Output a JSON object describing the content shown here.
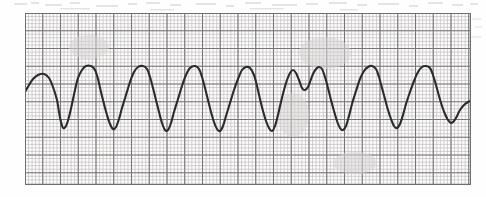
{
  "document": {
    "type": "ecg-rhythm-strip",
    "caption": "",
    "background_color": "#fefefe",
    "paper_color": "#fdfdfd"
  },
  "strip": {
    "label": "ecg-rhythm-strip",
    "x": 25,
    "y": 13,
    "width": 446,
    "height": 172,
    "border_color": "#6f6f6f",
    "trace_color": "#2b2b2b",
    "minor_grid_color": "#b9b4b4",
    "major_grid_color": "#7b7676",
    "minor_grid_px": 3.55,
    "major_grid_px": 17.75
  },
  "chart_data": {
    "type": "line",
    "title": "",
    "subtitle": "",
    "xlabel": "",
    "ylabel": "",
    "grid": true,
    "legend": "none",
    "rhythm_name": "sine-wave wide-complex tachycardia",
    "baseline_y": 100,
    "peak_y": 66,
    "trough_y": 133,
    "amplitude_mm": 19,
    "cycle_count": 13,
    "cycle_px": 33.5,
    "xlim": [
      25,
      471
    ],
    "ylim": [
      13,
      185
    ],
    "axis_units": {
      "x": "0.04 s per small square",
      "y": "0.1 mV per small square"
    },
    "peaks_x": [
      44,
      75,
      109,
      143,
      176,
      210,
      244,
      277,
      306,
      340,
      371,
      404,
      438
    ],
    "troughs_x": [
      58,
      92,
      126,
      159,
      193,
      226,
      259,
      291,
      324,
      356,
      388,
      421
    ],
    "series": [
      {
        "name": "lead-ii",
        "points": [
          [
            25,
            92
          ],
          [
            29,
            85
          ],
          [
            33,
            79
          ],
          [
            38,
            75
          ],
          [
            44,
            74
          ],
          [
            49,
            78
          ],
          [
            53,
            87
          ],
          [
            57,
            100
          ],
          [
            59,
            112
          ],
          [
            61,
            122
          ],
          [
            63,
            128
          ],
          [
            66,
            126
          ],
          [
            69,
            117
          ],
          [
            72,
            104
          ],
          [
            75,
            90
          ],
          [
            78,
            78
          ],
          [
            82,
            70
          ],
          [
            86,
            66
          ],
          [
            91,
            66
          ],
          [
            95,
            70
          ],
          [
            98,
            79
          ],
          [
            101,
            92
          ],
          [
            104,
            104
          ],
          [
            107,
            115
          ],
          [
            110,
            124
          ],
          [
            113,
            129
          ],
          [
            116,
            127
          ],
          [
            119,
            119
          ],
          [
            122,
            108
          ],
          [
            126,
            95
          ],
          [
            130,
            82
          ],
          [
            134,
            72
          ],
          [
            138,
            67
          ],
          [
            143,
            66
          ],
          [
            147,
            69
          ],
          [
            150,
            77
          ],
          [
            153,
            88
          ],
          [
            156,
            100
          ],
          [
            159,
            112
          ],
          [
            162,
            123
          ],
          [
            165,
            130
          ],
          [
            168,
            130
          ],
          [
            171,
            123
          ],
          [
            174,
            112
          ],
          [
            178,
            99
          ],
          [
            182,
            86
          ],
          [
            186,
            75
          ],
          [
            190,
            68
          ],
          [
            195,
            66
          ],
          [
            199,
            69
          ],
          [
            202,
            77
          ],
          [
            205,
            88
          ],
          [
            208,
            100
          ],
          [
            211,
            112
          ],
          [
            214,
            122
          ],
          [
            217,
            129
          ],
          [
            220,
            131
          ],
          [
            223,
            126
          ],
          [
            226,
            116
          ],
          [
            230,
            103
          ],
          [
            234,
            90
          ],
          [
            238,
            79
          ],
          [
            242,
            70
          ],
          [
            246,
            67
          ],
          [
            250,
            68
          ],
          [
            254,
            75
          ],
          [
            257,
            86
          ],
          [
            260,
            99
          ],
          [
            263,
            111
          ],
          [
            266,
            121
          ],
          [
            269,
            128
          ],
          [
            272,
            131
          ],
          [
            275,
            126
          ],
          [
            278,
            115
          ],
          [
            281,
            102
          ],
          [
            284,
            90
          ],
          [
            287,
            80
          ],
          [
            290,
            73
          ],
          [
            293,
            70
          ],
          [
            296,
            73
          ],
          [
            299,
            80
          ],
          [
            302,
            88
          ],
          [
            305,
            90
          ],
          [
            308,
            87
          ],
          [
            310,
            82
          ],
          [
            313,
            74
          ],
          [
            316,
            69
          ],
          [
            319,
            67
          ],
          [
            322,
            69
          ],
          [
            325,
            77
          ],
          [
            328,
            88
          ],
          [
            331,
            100
          ],
          [
            334,
            111
          ],
          [
            337,
            121
          ],
          [
            340,
            128
          ],
          [
            343,
            130
          ],
          [
            346,
            126
          ],
          [
            349,
            116
          ],
          [
            352,
            104
          ],
          [
            356,
            91
          ],
          [
            360,
            79
          ],
          [
            364,
            71
          ],
          [
            368,
            67
          ],
          [
            372,
            66
          ],
          [
            376,
            69
          ],
          [
            379,
            77
          ],
          [
            382,
            88
          ],
          [
            385,
            99
          ],
          [
            388,
            110
          ],
          [
            391,
            119
          ],
          [
            394,
            126
          ],
          [
            397,
            128
          ],
          [
            400,
            124
          ],
          [
            403,
            115
          ],
          [
            406,
            104
          ],
          [
            410,
            92
          ],
          [
            414,
            81
          ],
          [
            418,
            72
          ],
          [
            422,
            67
          ],
          [
            426,
            66
          ],
          [
            430,
            68
          ],
          [
            433,
            75
          ],
          [
            436,
            85
          ],
          [
            439,
            96
          ],
          [
            442,
            106
          ],
          [
            445,
            114
          ],
          [
            448,
            120
          ],
          [
            451,
            123
          ],
          [
            454,
            121
          ],
          [
            457,
            116
          ],
          [
            460,
            110
          ],
          [
            464,
            105
          ],
          [
            468,
            102
          ],
          [
            471,
            101
          ]
        ]
      }
    ]
  }
}
